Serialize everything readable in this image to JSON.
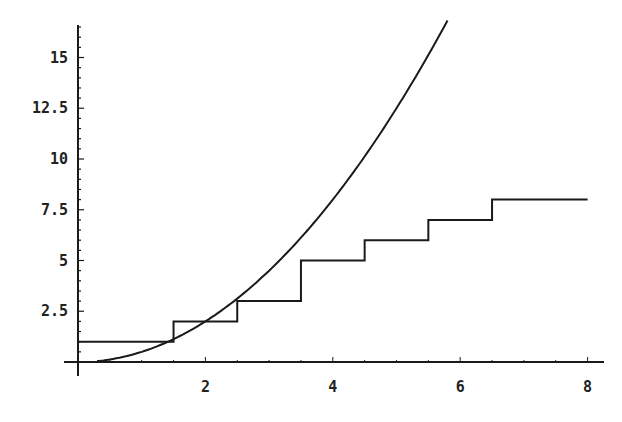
{
  "chart_data": {
    "type": "line",
    "title": "",
    "xlabel": "",
    "ylabel": "",
    "xlim": [
      0,
      8.2
    ],
    "ylim": [
      0,
      16.6
    ],
    "grid": false,
    "legend": null,
    "x_ticks": [
      "2",
      "4",
      "6",
      "8"
    ],
    "y_ticks": [
      "2.5",
      "5",
      "7.5",
      "10",
      "12.5",
      "15"
    ],
    "series": [
      {
        "name": "curve",
        "kind": "function",
        "description": "y = x^2/2",
        "x": [
          0.5,
          1,
          1.5,
          2,
          2.5,
          3,
          3.5,
          4,
          4.5,
          5,
          5.5,
          5.8
        ],
        "y": [
          0.125,
          0.5,
          1.125,
          2,
          3.125,
          4.5,
          6.125,
          8,
          10.125,
          12.5,
          15.125,
          16.82
        ]
      },
      {
        "name": "step",
        "kind": "step",
        "x_breaks": [
          0,
          1.5,
          2.5,
          3.5,
          4.5,
          5.5,
          6.5,
          8
        ],
        "levels": [
          1,
          2,
          3,
          5,
          6,
          7,
          8
        ]
      }
    ]
  },
  "colors": {
    "line": "#1a1a1a",
    "axis": "#1a1a1a",
    "background": "#ffffff"
  }
}
